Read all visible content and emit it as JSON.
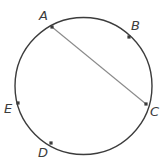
{
  "figure": {
    "kind": "circle-geometry-diagram",
    "background_color": "#ffffff",
    "circle": {
      "center_x": 83.5,
      "center_y": 86,
      "radius": 68.5,
      "stroke_color": "#3c3c3c",
      "stroke_width": 1.4,
      "fill": "none"
    },
    "chord": {
      "from": "A",
      "to": "C",
      "stroke_color": "#8a8a8a",
      "stroke_width": 1.1
    },
    "point_marker": {
      "color": "#3c3c3c",
      "size": 3.2,
      "shape": "square"
    },
    "points": [
      {
        "label": "A",
        "x": 52,
        "y": 27,
        "label_x": 39,
        "label_y": 20
      },
      {
        "label": "B",
        "x": 129,
        "y": 37,
        "label_x": 131,
        "label_y": 30
      },
      {
        "label": "C",
        "x": 146,
        "y": 104,
        "label_x": 150,
        "label_y": 116
      },
      {
        "label": "D",
        "x": 51,
        "y": 143,
        "label_x": 38,
        "label_y": 157
      },
      {
        "label": "E",
        "x": 18,
        "y": 103,
        "label_x": 4,
        "label_y": 113
      }
    ]
  }
}
